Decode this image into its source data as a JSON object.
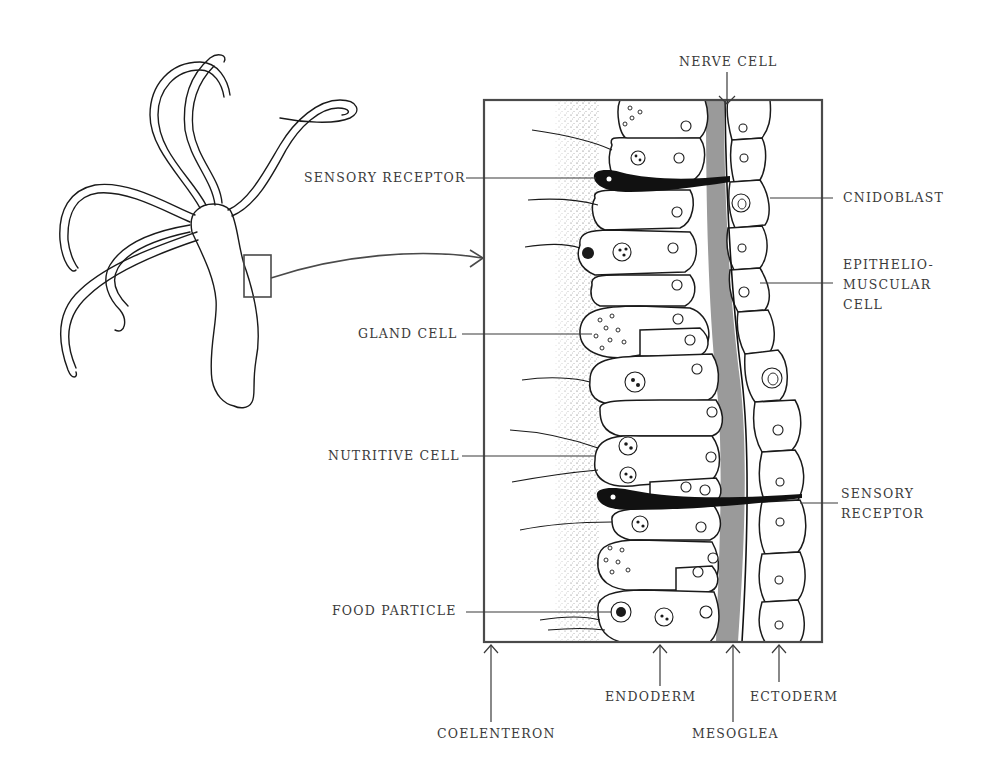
{
  "figure": {
    "overview": {
      "name": "hydra-whole-organism",
      "inset_box": "enlarged-region"
    },
    "labels_left": {
      "sensory_receptor": "SENSORY RECEPTOR",
      "gland_cell": "GLAND CELL",
      "nutritive_cell": "NUTRITIVE CELL",
      "food_particle": "FOOD PARTICLE"
    },
    "labels_top": {
      "nerve_cell": "NERVE CELL"
    },
    "labels_right": {
      "cnidoblast": "CNIDOBLAST",
      "epitheliomuscular_cell": "EPITHELIO-\nMUSCULAR\nCELL",
      "sensory_receptor": "SENSORY\nRECEPTOR"
    },
    "labels_bottom": {
      "coelenteron": "COELENTERON",
      "endoderm": "ENDODERM",
      "mesoglea": "MESOGLEA",
      "ectoderm": "ECTODERM"
    },
    "colors": {
      "ink": "#1a1a1a",
      "label_text": "#3a3a3a",
      "mesoglea_gray": "#9a9a9a",
      "frame": "#4a4a4a",
      "background": "#ffffff"
    }
  }
}
